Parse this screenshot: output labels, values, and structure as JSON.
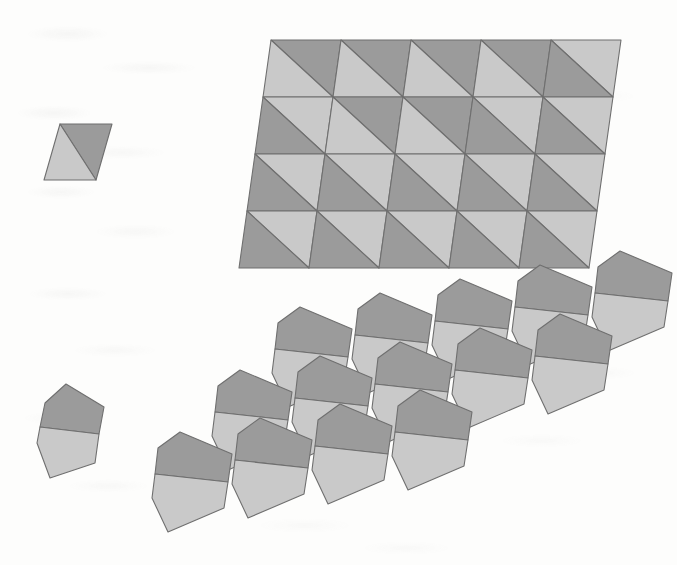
{
  "figure": {
    "type": "geometric-tiling-diagram",
    "medium": "scanned-book-page",
    "background_color": "#fdfdfc",
    "panels": [
      {
        "id": "prototile-a",
        "name": "Prototile A — diagonally bisected parallelogram",
        "role": "prototile",
        "paired_tiling": "tiling-a",
        "marking": "single diagonal from lower-left to upper-right splitting the tile into a dark half and a light half"
      },
      {
        "id": "tiling-a",
        "name": "Tiling A — 5 by 4 array of bisected parallelograms",
        "role": "tiling",
        "columns": 5,
        "rows": 4,
        "tile_count": 20,
        "outline": "overall shape is a large leaning parallelogram"
      },
      {
        "id": "prototile-b",
        "name": "Prototile B — hexagonal tile split by a horizontal chord",
        "role": "prototile",
        "paired_tiling": "tiling-b",
        "marking": "horizontal chord splitting the tile into a dark upper region and a light lower region"
      },
      {
        "id": "tiling-b",
        "name": "Tiling B — staggered diagonal rows of hexagonal tiles",
        "role": "tiling",
        "rows": 3,
        "tiles_per_row": [
          5,
          5,
          4
        ],
        "tile_count": 14,
        "outline": "stepped band rising from lower-left to upper-right"
      }
    ],
    "colors": {
      "dark_fill": "#9b9b9b",
      "light_fill": "#c9c9c9",
      "stroke": "#6f6f6f",
      "paper": "#fdfdfc"
    },
    "stroke_width": 1.1,
    "geometry": {
      "prototile_a": {
        "vertices": [
          [
            60,
            124
          ],
          [
            112,
            124
          ],
          [
            96,
            180
          ],
          [
            44,
            180
          ]
        ],
        "diagonal": [
          [
            44,
            180
          ],
          [
            112,
            124
          ]
        ],
        "dark_part": "upper-right triangle",
        "light_part": "lower-left triangle"
      },
      "tiling_a": {
        "origin": [
          271,
          40
        ],
        "col_step": [
          70.0,
          0.0
        ],
        "row_step": [
          -8.0,
          57.0
        ],
        "cell_width": 70.0,
        "cell_height": 57.0,
        "diagonal_orientation_grid": [
          [
            "light-lower-left",
            "light-lower-left",
            "light-lower-left",
            "light-lower-left",
            "light-upper-right"
          ],
          [
            "dark-lower-left",
            "light-lower-left",
            "light-lower-left",
            "light-upper-right",
            "dark-lower-left"
          ],
          [
            "dark-lower-left",
            "light-upper-right",
            "light-upper-right",
            "light-upper-right",
            "dark-lower-left"
          ],
          [
            "dark-lower-left",
            "light-upper-right",
            "light-upper-right",
            "light-upper-right",
            "dark-lower-left"
          ]
        ]
      },
      "prototile_b": {
        "vertices": [
          [
            66,
            384
          ],
          [
            104,
            407
          ],
          [
            95,
            463
          ],
          [
            50,
            478
          ],
          [
            37,
            443
          ],
          [
            45,
            403
          ]
        ],
        "chord": [
          [
            40,
            427
          ],
          [
            99,
            434
          ]
        ],
        "dark_part": "upper region",
        "light_part": "lower region"
      },
      "tiling_b": {
        "row_origins": [
          [
            300,
            307
          ],
          [
            240,
            370
          ],
          [
            180,
            432
          ]
        ],
        "col_step": [
          80.0,
          -14.0
        ],
        "row_step": [
          -60.0,
          62.0
        ],
        "tile_width": 80.0,
        "tile_height": 100.0
      }
    }
  }
}
